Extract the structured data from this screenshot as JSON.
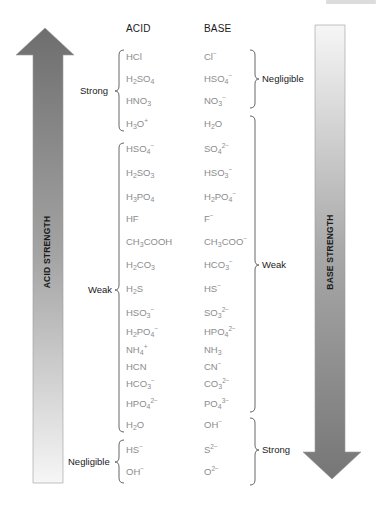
{
  "diagram": {
    "columns": {
      "acid": "ACID",
      "base": "BASE"
    },
    "arrows": {
      "left": {
        "label": "ACID STRENGTH",
        "direction": "up",
        "color_dark": "#6e6e6e",
        "color_light": "#f4f4f4"
      },
      "right": {
        "label": "BASE STRENGTH",
        "direction": "down",
        "color_dark": "#7a7a7a",
        "color_light": "#f4f4f4"
      }
    },
    "acid_groups": [
      {
        "label": "Strong",
        "from_row": 0,
        "to_row": 3
      },
      {
        "label": "Weak",
        "from_row": 4,
        "to_row": 17
      },
      {
        "label": "Negligible",
        "from_row": 18,
        "to_row": 19
      }
    ],
    "base_groups": [
      {
        "label": "Negligible",
        "from_row": 0,
        "to_row": 2
      },
      {
        "label": "Weak",
        "from_row": 3,
        "to_row": 16
      },
      {
        "label": "Strong",
        "from_row": 17,
        "to_row": 19
      }
    ],
    "pairs": [
      {
        "acid": "HCl",
        "base": "Cl⁻"
      },
      {
        "acid": "H2SO4",
        "base": "HSO4⁻"
      },
      {
        "acid": "HNO3",
        "base": "NO3⁻"
      },
      {
        "acid": "H3O⁺",
        "base": "H2O"
      },
      {
        "acid": "HSO4⁻",
        "base": "SO4²⁻"
      },
      {
        "acid": "H2SO3",
        "base": "HSO3⁻"
      },
      {
        "acid": "H3PO4",
        "base": "H2PO4⁻"
      },
      {
        "acid": "HF",
        "base": "F⁻"
      },
      {
        "acid": "CH3COOH",
        "base": "CH3COO⁻"
      },
      {
        "acid": "H2CO3",
        "base": "HCO3⁻"
      },
      {
        "acid": "H2S",
        "base": "HS⁻"
      },
      {
        "acid": "HSO3⁻",
        "base": "SO3²⁻"
      },
      {
        "acid": "H2PO4⁻",
        "base": "HPO4²⁻"
      },
      {
        "acid": "NH4⁺",
        "base": "NH3"
      },
      {
        "acid": "HCN",
        "base": "CN⁻"
      },
      {
        "acid": "HCO3⁻",
        "base": "CO3²⁻"
      },
      {
        "acid": "HPO4²⁻",
        "base": "PO4³⁻"
      },
      {
        "acid": "H2O",
        "base": "OH⁻"
      },
      {
        "acid": "HS⁻",
        "base": "S²⁻"
      },
      {
        "acid": "OH⁻",
        "base": "O²⁻"
      }
    ],
    "colors": {
      "formula_text": "#8c8c8c",
      "label_text": "#1a1a1a",
      "brace": "#555555"
    }
  }
}
